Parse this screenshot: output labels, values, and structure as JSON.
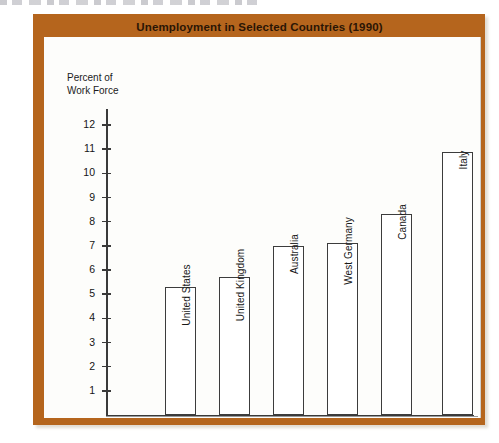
{
  "figure": {
    "title": "Unemployment in Selected Countries (1990)",
    "axis_label_line1": "Percent of",
    "axis_label_line2": "Work Force",
    "frame_color": "#b5651d",
    "panel_color": "#fdfdfb",
    "bar_outline_color": "#3c3c3c",
    "bar_fill_color": "#ffffff"
  },
  "chart_data": {
    "type": "bar",
    "title": "Unemployment in Selected Countries (1990)",
    "xlabel": "",
    "ylabel": "Percent of Work Force",
    "ylim": [
      0,
      12.6
    ],
    "yticks": [
      1,
      2,
      3,
      4,
      5,
      6,
      7,
      8,
      9,
      10,
      11,
      12
    ],
    "ytick_labels": [
      "1",
      "2",
      "3",
      "4",
      "5",
      "6",
      "7",
      "8",
      "9",
      "10",
      "11",
      "12"
    ],
    "grid": false,
    "legend": null,
    "orientation": "vertical",
    "categories": [
      "United States",
      "United Kingdom",
      "Australia",
      "West Germany",
      "Canada",
      "Italy"
    ],
    "values": [
      5.3,
      5.7,
      7.0,
      7.1,
      8.3,
      10.9
    ],
    "bars": [
      {
        "label": "United States",
        "value": 5.3
      },
      {
        "label": "United Kingdom",
        "value": 5.7
      },
      {
        "label": "Australia",
        "value": 7.0
      },
      {
        "label": "West Germany",
        "value": 7.1
      },
      {
        "label": "Canada",
        "value": 8.3
      },
      {
        "label": "Italy",
        "value": 10.9
      }
    ]
  }
}
